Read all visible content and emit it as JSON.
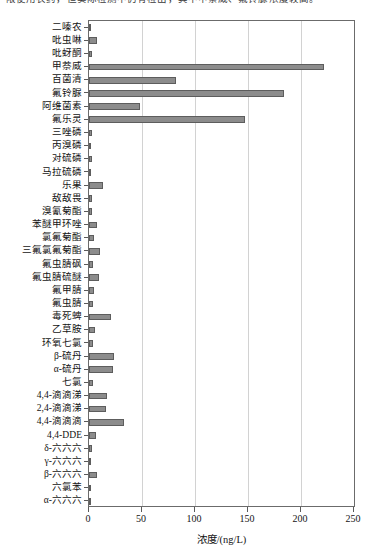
{
  "page": {
    "top_clipped_text": "限使用农药，但实际检测中仍有检出，其中甲萘威、氟铃脲浓度较高。"
  },
  "chart_data": {
    "type": "bar",
    "orientation": "horizontal",
    "title": "",
    "xlabel": "浓度/(ng/L)",
    "ylabel": "",
    "xlim": [
      0,
      250
    ],
    "xticks": [
      0,
      50,
      100,
      150,
      200,
      250
    ],
    "xtick_labels": [
      "0",
      "50",
      "100",
      "150",
      "200",
      "250"
    ],
    "grid": "vertical",
    "legend": "none",
    "bar_color": "#8c8c8c",
    "bar_edge_color": "#5d5d5d",
    "categories": [
      "二嗪农",
      "吡虫啉",
      "吡蚜酮",
      "甲萘威",
      "百菌清",
      "氟铃脲",
      "阿维菌素",
      "氟乐灵",
      "三唑磷",
      "丙溴磷",
      "对硫磷",
      "马拉硫磷",
      "乐果",
      "敌敌畏",
      "溴氰菊酯",
      "苯醚甲环唑",
      "氯氟菊酯",
      "三氟氯氟菊酯",
      "氟虫腈砜",
      "氟虫腈硫醚",
      "氟甲腈",
      "氟虫腈",
      "毒死蜱",
      "乙草胺",
      "环氧七氯",
      "β-硫丹",
      "α-硫丹",
      "七氯",
      "4,4-滴滴涕",
      "2,4-滴滴涕",
      "4,4-滴滴滴",
      "4,4-DDE",
      "δ-六六六",
      "γ-六六六",
      "β-六六六",
      "六氯苯",
      "α-六六六"
    ],
    "values": [
      1.5,
      8.0,
      3.0,
      222.0,
      82.0,
      184.0,
      48.0,
      147.0,
      3.0,
      1.0,
      2.5,
      2.0,
      13.0,
      2.5,
      3.0,
      8.0,
      5.0,
      10.0,
      4.0,
      9.0,
      5.0,
      4.0,
      21.0,
      6.0,
      4.0,
      24.0,
      23.0,
      4.0,
      17.0,
      16.0,
      33.0,
      7.0,
      3.0,
      1.0,
      8.0,
      1.0,
      1.0
    ],
    "units": "ng/L"
  }
}
